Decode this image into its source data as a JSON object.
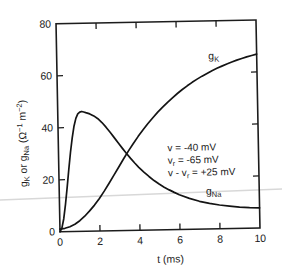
{
  "figure": {
    "ink": "#1c1c1c",
    "curve_color": "#141414",
    "artifact_color": "#d8d8d8",
    "background": "#ffffff"
  },
  "chart_data": {
    "type": "line",
    "title": "",
    "xlabel": "t (ms)",
    "ylabel": "gK or gNa (Ω−1 m−2)",
    "ylabel_segments": [
      {
        "t": "g"
      },
      {
        "t": "K",
        "sub": true
      },
      {
        "t": " or g"
      },
      {
        "t": "Na",
        "sub": true
      },
      {
        "t": " (Ω"
      },
      {
        "t": "−1",
        "sup": true
      },
      {
        "t": " m"
      },
      {
        "t": "−2",
        "sup": true
      },
      {
        "t": ")"
      }
    ],
    "xlim": [
      0,
      10
    ],
    "ylim": [
      0,
      80
    ],
    "xticks": [
      0,
      2,
      4,
      6,
      8,
      10
    ],
    "yticks": [
      0,
      20,
      40,
      60,
      80
    ],
    "grid": false,
    "legend_position": "inline-labels",
    "series": [
      {
        "name": "gK",
        "label_segments": [
          {
            "t": "g"
          },
          {
            "t": "K",
            "sub": true
          }
        ],
        "label_anchor": {
          "t": 7.85,
          "g": 65.2
        },
        "points": [
          [
            0,
            1
          ],
          [
            0.25,
            1.3
          ],
          [
            0.5,
            1.9
          ],
          [
            0.75,
            2.8
          ],
          [
            1,
            4.1
          ],
          [
            1.25,
            5.8
          ],
          [
            1.5,
            7.8
          ],
          [
            1.75,
            10
          ],
          [
            2,
            12.5
          ],
          [
            2.25,
            15.3
          ],
          [
            2.5,
            18.3
          ],
          [
            2.75,
            21.4
          ],
          [
            3,
            24.5
          ],
          [
            3.25,
            27.6
          ],
          [
            3.5,
            30.6
          ],
          [
            3.75,
            33.4
          ],
          [
            4,
            36.1
          ],
          [
            4.25,
            38.6
          ],
          [
            4.5,
            41
          ],
          [
            4.75,
            43.2
          ],
          [
            5,
            45.3
          ],
          [
            5.25,
            47.2
          ],
          [
            5.5,
            49
          ],
          [
            5.75,
            50.7
          ],
          [
            6,
            52.3
          ],
          [
            6.25,
            53.8
          ],
          [
            6.5,
            55.2
          ],
          [
            6.75,
            56.5
          ],
          [
            7,
            57.7
          ],
          [
            7.25,
            58.8
          ],
          [
            7.5,
            59.8
          ],
          [
            7.75,
            60.8
          ],
          [
            8,
            61.7
          ],
          [
            8.25,
            62.5
          ],
          [
            8.5,
            63.3
          ],
          [
            8.75,
            64
          ],
          [
            9,
            64.7
          ],
          [
            9.25,
            65.3
          ],
          [
            9.5,
            65.9
          ],
          [
            9.75,
            66.4
          ],
          [
            10,
            66.9
          ]
        ]
      },
      {
        "name": "gNa",
        "label_segments": [
          {
            "t": "g"
          },
          {
            "t": "Na",
            "sub": true
          }
        ],
        "label_anchor": {
          "t": 7.72,
          "g": 13.2
        },
        "points": [
          [
            0,
            0
          ],
          [
            0.1,
            1.5
          ],
          [
            0.2,
            5
          ],
          [
            0.3,
            10.5
          ],
          [
            0.4,
            17
          ],
          [
            0.5,
            24
          ],
          [
            0.6,
            30.5
          ],
          [
            0.7,
            36
          ],
          [
            0.8,
            40.5
          ],
          [
            0.9,
            43.5
          ],
          [
            1,
            45.2
          ],
          [
            1.1,
            45.9
          ],
          [
            1.2,
            46.1
          ],
          [
            1.3,
            45.9
          ],
          [
            1.4,
            45.6
          ],
          [
            1.6,
            45.1
          ],
          [
            1.8,
            44.3
          ],
          [
            2,
            43.2
          ],
          [
            2.2,
            41.7
          ],
          [
            2.4,
            39.9
          ],
          [
            2.6,
            37.9
          ],
          [
            2.8,
            35.8
          ],
          [
            3,
            33.7
          ],
          [
            3.2,
            31.6
          ],
          [
            3.4,
            29.6
          ],
          [
            3.6,
            27.7
          ],
          [
            3.8,
            25.9
          ],
          [
            4,
            24.2
          ],
          [
            4.25,
            22.3
          ],
          [
            4.5,
            20.6
          ],
          [
            4.75,
            19
          ],
          [
            5,
            17.6
          ],
          [
            5.25,
            16.4
          ],
          [
            5.5,
            15.3
          ],
          [
            5.75,
            14.3
          ],
          [
            6,
            13.4
          ],
          [
            6.5,
            11.9
          ],
          [
            7,
            10.7
          ],
          [
            7.5,
            9.8
          ],
          [
            8,
            9.1
          ],
          [
            8.5,
            8.6
          ],
          [
            9,
            8.2
          ],
          [
            9.5,
            7.9
          ],
          [
            10,
            7.7
          ]
        ]
      }
    ],
    "annotation": {
      "lines": [
        {
          "segments": [
            {
              "t": "v = -40 mV"
            }
          ]
        },
        {
          "segments": [
            {
              "t": "v"
            },
            {
              "t": "r",
              "sub": true
            },
            {
              "t": " = -65 mV"
            }
          ]
        },
        {
          "segments": [
            {
              "t": "v - v"
            },
            {
              "t": "r",
              "sub": true
            },
            {
              "t": " = +25 mV"
            }
          ]
        }
      ]
    }
  }
}
